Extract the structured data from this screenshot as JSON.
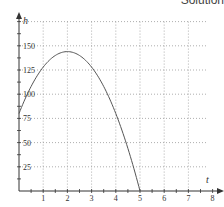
{
  "header": {
    "title": "Solution"
  },
  "chart_data": {
    "type": "line",
    "title": "Solution",
    "xlabel": "t",
    "ylabel": "h",
    "xlim": [
      0,
      8
    ],
    "ylim": [
      0,
      175
    ],
    "x_ticks": [
      1,
      2,
      3,
      4,
      5,
      6,
      7,
      8
    ],
    "y_ticks": [
      25,
      50,
      75,
      100,
      125,
      150
    ],
    "grid": true,
    "grid_style": "dotted",
    "series": [
      {
        "name": "h(t) = -16t^2 + 64t + 80",
        "x": [
          0,
          0.5,
          1,
          1.5,
          2,
          2.5,
          3,
          3.5,
          4,
          4.5,
          5
        ],
        "values": [
          80,
          108,
          128,
          140,
          144,
          140,
          128,
          108,
          80,
          44,
          0
        ]
      }
    ],
    "colors": {
      "curve": "#555555",
      "axis": "#333333",
      "grid": "#999999"
    }
  }
}
